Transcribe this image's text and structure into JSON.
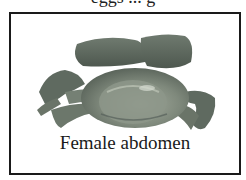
{
  "figure": {
    "top_text_partial": "eggs ... g",
    "caption": "Female abdomen",
    "colors": {
      "frame_border": "#1a1a1a",
      "crab_body": "#7d877a",
      "crab_shadow": "#4f5a52",
      "background": "#ffffff"
    }
  }
}
